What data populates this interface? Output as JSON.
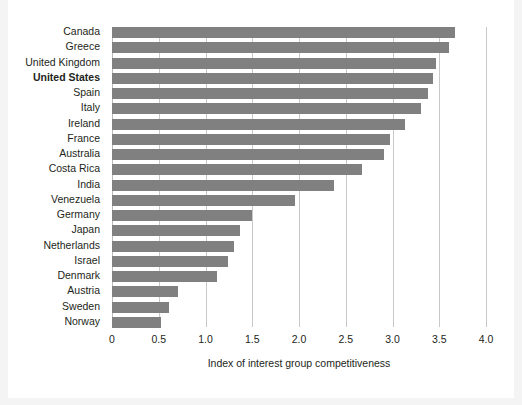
{
  "chart_data": {
    "type": "bar",
    "orientation": "horizontal",
    "title": "",
    "subtitle": "",
    "xlabel": "Index of interest group competitiveness",
    "ylabel": "",
    "xlim": [
      0,
      4.0
    ],
    "xticks": [
      "0",
      "0.5",
      "1.0",
      "1.5",
      "2.0",
      "2.5",
      "3.0",
      "3.5",
      "4.0"
    ],
    "xtick_values": [
      0,
      0.5,
      1.0,
      1.5,
      2.0,
      2.5,
      3.0,
      3.5,
      4.0
    ],
    "grid": "vertical",
    "legend": "none",
    "bar_color": "#808080",
    "gridline_color": "#c9c9c9",
    "highlight_category": "United States",
    "categories": [
      "Canada",
      "Greece",
      "United Kingdom",
      "United States",
      "Spain",
      "Italy",
      "Ireland",
      "France",
      "Australia",
      "Costa Rica",
      "India",
      "Venezuela",
      "Germany",
      "Japan",
      "Netherlands",
      "Israel",
      "Denmark",
      "Austria",
      "Sweden",
      "Norway"
    ],
    "values": [
      3.67,
      3.6,
      3.47,
      3.43,
      3.38,
      3.3,
      3.13,
      2.97,
      2.91,
      2.67,
      2.37,
      1.96,
      1.5,
      1.37,
      1.31,
      1.24,
      1.12,
      0.71,
      0.61,
      0.52
    ],
    "series": [
      {
        "name": "Index of interest group competitiveness",
        "values": [
          3.67,
          3.6,
          3.47,
          3.43,
          3.38,
          3.3,
          3.13,
          2.97,
          2.91,
          2.67,
          2.37,
          1.96,
          1.5,
          1.37,
          1.31,
          1.24,
          1.12,
          0.71,
          0.61,
          0.52
        ]
      }
    ]
  }
}
